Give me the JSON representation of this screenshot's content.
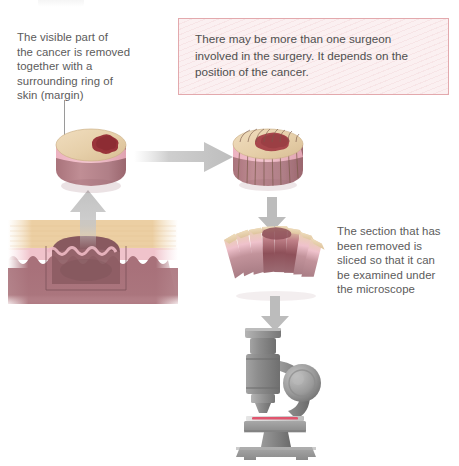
{
  "figure": {
    "title_present": false,
    "background": "#ffffff",
    "type": "medical-illustration"
  },
  "captions": {
    "left": {
      "name": "excision-caption",
      "text": "The visible part of\nthe cancer is removed\ntogether with a\nsurrounding ring of\nskin (margin)",
      "lines": [
        "The visible part of",
        "the cancer is removed",
        "together with a",
        "surrounding ring of",
        "skin (margin)"
      ],
      "color": "#5b5b5b"
    },
    "right": {
      "name": "microscope-caption",
      "text": "The section that has\nbeen removed is\nsliced so that it can\nbe examined under\nthe microscope",
      "lines": [
        "The section that has",
        "been removed is",
        "sliced so that it can",
        "be examined under",
        "the microscope"
      ],
      "color": "#5b5b5b"
    }
  },
  "callout": {
    "name": "surgeon-note",
    "text": "There may be more than one surgeon\ninvolved in the surgery. It depends on the\nposition of the cancer.",
    "lines": [
      "There may be more than one surgeon",
      "involved in the surgery. It depends on the",
      "position of the cancer."
    ],
    "background": "#fbf0f1",
    "border_color": "#e3a9ad",
    "text_color": "#4f4f4f"
  },
  "illustrations": {
    "skin_cross_section": {
      "name": "skin-cross-section",
      "label": "skin cross-section with tumour and excision outline",
      "layers": [
        {
          "name": "epidermis",
          "color": "#eccfa3"
        },
        {
          "name": "upper-dermis",
          "color": "#f0c3cb"
        },
        {
          "name": "dermis",
          "color": "#a8717a"
        }
      ],
      "tumour_color": "#8d5c63",
      "outline_color": "#7a5057"
    },
    "specimen_whole": {
      "name": "excised-specimen-cylinder",
      "label": "excised cylinder of skin with visible cancer on surface",
      "top_color": "#e6cfa9",
      "band_color": "#f0bcc8",
      "body_color": "#b9838a",
      "tumour_color": "#99333a"
    },
    "specimen_scored": {
      "name": "specimen-marked-for-slicing",
      "label": "specimen marked with vertical cutting lines",
      "top_color": "#e6cfa9",
      "band_color": "#f0bcc8",
      "body_color": "#b9838a",
      "tumour_color": "#a8474c",
      "score_line_color": "#7b5a4a",
      "slice_count": 9
    },
    "specimen_sliced": {
      "name": "specimen-sliced-sections",
      "label": "specimen fanned out into individual slices",
      "slice_count": 9,
      "top_color": "#e8d2ad",
      "band_color": "#efc2cc",
      "body_color": "#b5848c",
      "tumour_color": "#8e5059"
    },
    "microscope": {
      "name": "microscope",
      "label": "light microscope examining the slide",
      "body_color": "#8d8d8d",
      "dark_color": "#6f6f6f",
      "light_color": "#b4b4b4",
      "slide_color": "#d9d9d9",
      "specimen_stain_color": "#e0556e"
    }
  },
  "arrows": [
    {
      "name": "arrow-skin-to-specimen",
      "direction": "up",
      "color": "#c2c2c2",
      "style": "gradient-fade-bottom"
    },
    {
      "name": "arrow-specimen-to-scored",
      "direction": "right",
      "color": "#bdbdbd",
      "style": "gradient-fade-left"
    },
    {
      "name": "arrow-scored-to-sliced",
      "direction": "down",
      "color": "#b9b9b9",
      "style": "solid"
    },
    {
      "name": "arrow-sliced-to-microscope",
      "direction": "down",
      "color": "#b9b9b9",
      "style": "solid"
    }
  ]
}
